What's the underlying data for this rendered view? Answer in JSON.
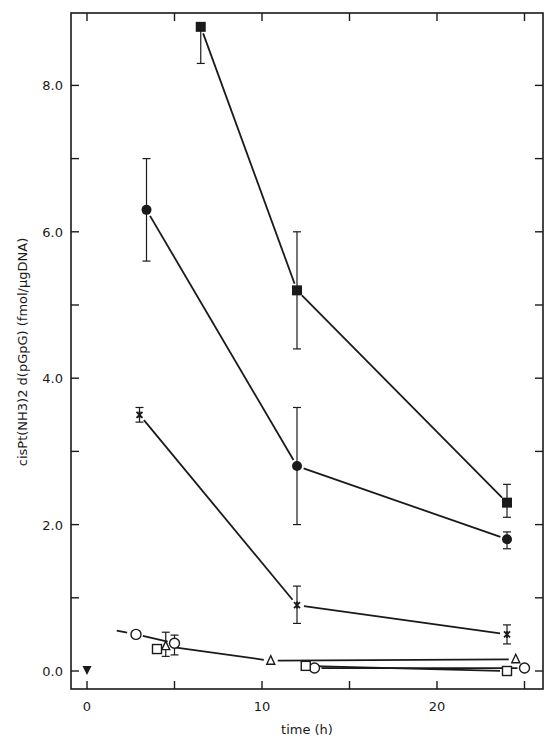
{
  "chart_data": {
    "type": "line",
    "title": "",
    "xlabel": "time (h)",
    "ylabel": "cisPt(NH3)2 d(pGpG) (fmol/µgDNA)",
    "xlim": [
      -1,
      26
    ],
    "ylim": [
      -0.25,
      8.8
    ],
    "x_ticks": [
      0,
      10,
      20
    ],
    "x_tick_labels": [
      "0",
      "10",
      "20"
    ],
    "x_minor_ticks": [
      5,
      15,
      25
    ],
    "y_ticks": [
      0,
      2,
      4,
      6,
      8
    ],
    "y_tick_labels": [
      "0.0",
      "2.0",
      "4.0",
      "6.0",
      "8.0"
    ],
    "y_minor_ticks": [
      1,
      3,
      5,
      7
    ],
    "grid": false,
    "legend": "none",
    "series": [
      {
        "name": "filled-square",
        "marker": "filled-square",
        "points": [
          {
            "x": 6.5,
            "y": 8.8,
            "err_low": 8.3,
            "err_high": 8.8
          },
          {
            "x": 12,
            "y": 5.2,
            "err_low": 4.4,
            "err_high": 6.0
          },
          {
            "x": 24,
            "y": 2.3,
            "err_low": 2.1,
            "err_high": 2.55
          }
        ],
        "segments": [
          [
            0,
            1
          ],
          [
            1,
            2
          ]
        ]
      },
      {
        "name": "filled-circle",
        "marker": "filled-circle",
        "points": [
          {
            "x": 3.4,
            "y": 6.3,
            "err_low": 5.6,
            "err_high": 7.0
          },
          {
            "x": 12,
            "y": 2.8,
            "err_low": 2.0,
            "err_high": 3.6
          },
          {
            "x": 24,
            "y": 1.8,
            "err_low": 1.67,
            "err_high": 1.9
          }
        ],
        "segments": [
          [
            0,
            1
          ],
          [
            1,
            2
          ]
        ]
      },
      {
        "name": "star",
        "marker": "star",
        "points": [
          {
            "x": 3,
            "y": 3.5,
            "err_low": 3.4,
            "err_high": 3.6
          },
          {
            "x": 12,
            "y": 0.9,
            "err_low": 0.65,
            "err_high": 1.16
          },
          {
            "x": 24,
            "y": 0.5,
            "err_low": 0.37,
            "err_high": 0.63
          }
        ],
        "segments": [
          [
            0,
            1
          ],
          [
            1,
            2
          ]
        ]
      },
      {
        "name": "open-circle",
        "marker": "open-circle",
        "points": [
          {
            "x": 2.8,
            "y": 0.5
          },
          {
            "x": 5.0,
            "y": 0.38,
            "err_low": 0.22,
            "err_high": 0.49
          },
          {
            "x": 13,
            "y": 0.04
          },
          {
            "x": 25,
            "y": 0.04
          }
        ],
        "lead_in": {
          "x": 1.7,
          "y": 0.55
        },
        "segments": [
          [
            0,
            1
          ],
          [
            2,
            3
          ]
        ]
      },
      {
        "name": "open-triangle",
        "marker": "open-triangle",
        "points": [
          {
            "x": 4.5,
            "y": 0.34,
            "err_low": 0.2,
            "err_high": 0.53
          },
          {
            "x": 10.5,
            "y": 0.14
          },
          {
            "x": 24.5,
            "y": 0.16
          }
        ],
        "segments": [
          [
            0,
            1
          ],
          [
            1,
            2
          ]
        ]
      },
      {
        "name": "open-square",
        "marker": "open-square",
        "points": [
          {
            "x": 4.0,
            "y": 0.3
          },
          {
            "x": 12.5,
            "y": 0.07
          },
          {
            "x": 24,
            "y": 0.0
          }
        ],
        "segments": [
          [
            1,
            2
          ]
        ]
      },
      {
        "name": "filled-down-triangle",
        "marker": "filled-down-triangle",
        "points": [
          {
            "x": 0,
            "y": 0.0
          }
        ],
        "segments": []
      }
    ]
  }
}
